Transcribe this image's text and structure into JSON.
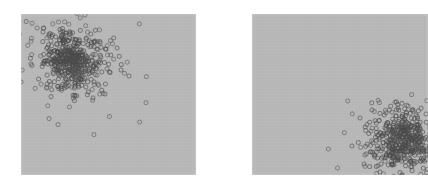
{
  "figure": {
    "title": "",
    "background_color": "#ffffff",
    "width": 428,
    "height": 194,
    "panel_count": 2
  },
  "panels": [
    {
      "name": "left-panel",
      "label": "",
      "x": 21,
      "y": 14,
      "width": 175,
      "height": 161,
      "background_color": "#b9b9b9",
      "clipped": false
    },
    {
      "name": "right-panel",
      "label": "",
      "x": 252,
      "y": 14,
      "width": 176,
      "height": 161,
      "background_color": "#b9b9b9",
      "clipped": true
    }
  ],
  "chart_data": [
    {
      "type": "scatter",
      "title": "",
      "subtitle": "",
      "xlabel": "",
      "ylabel": "",
      "panel": "left-panel",
      "grid": false,
      "legend": null,
      "xlim": [
        0,
        175
      ],
      "ylim": [
        0,
        161
      ],
      "marker": {
        "shape": "open-circle",
        "size_px": 4,
        "edge_color": "#4a4a4a",
        "fill_color": "none",
        "edge_width_px": 1,
        "opacity": 0.62
      },
      "cluster": {
        "center_x": 50,
        "center_y": 46,
        "spread_x": 15,
        "spread_y": 14,
        "n_points": 420
      },
      "outliers": [
        {
          "x": 64,
          "y": 1
        },
        {
          "x": 0,
          "y": 68
        },
        {
          "x": 10,
          "y": 50
        },
        {
          "x": 96,
          "y": 34
        },
        {
          "x": 100,
          "y": 56
        },
        {
          "x": 108,
          "y": 62
        },
        {
          "x": 84,
          "y": 80
        },
        {
          "x": 72,
          "y": 84
        },
        {
          "x": 54,
          "y": 82
        },
        {
          "x": 22,
          "y": 18
        }
      ]
    },
    {
      "type": "scatter",
      "title": "",
      "subtitle": "",
      "xlabel": "",
      "ylabel": "",
      "panel": "right-panel",
      "grid": false,
      "legend": null,
      "xlim": [
        0,
        176
      ],
      "ylim": [
        0,
        161
      ],
      "marker": {
        "shape": "open-circle",
        "size_px": 4,
        "edge_color": "#4a4a4a",
        "fill_color": "none",
        "edge_width_px": 1,
        "opacity": 0.62
      },
      "cluster": {
        "center_x": 151,
        "center_y": 126,
        "spread_x": 15,
        "spread_y": 14,
        "n_points": 420
      },
      "outliers": [
        {
          "x": 108,
          "y": 104
        },
        {
          "x": 100,
          "y": 132
        },
        {
          "x": 112,
          "y": 150
        },
        {
          "x": 128,
          "y": 158
        },
        {
          "x": 160,
          "y": 96
        },
        {
          "x": 174,
          "y": 100
        },
        {
          "x": 146,
          "y": 94
        },
        {
          "x": 120,
          "y": 96
        }
      ]
    }
  ]
}
